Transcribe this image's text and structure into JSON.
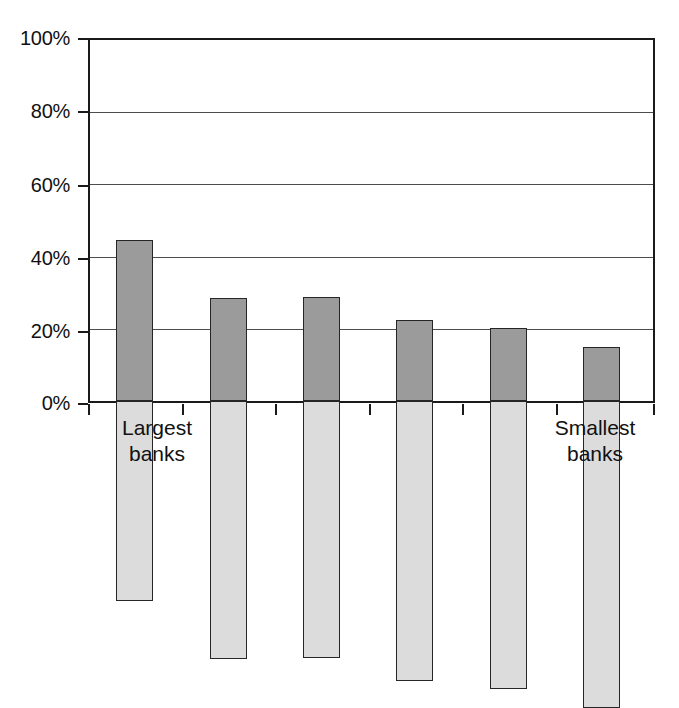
{
  "chart_data": {
    "type": "bar",
    "title": "",
    "subtitle": "",
    "xlabel": "",
    "ylabel": "",
    "stacked": true,
    "normalized": true,
    "grid": true,
    "legend": "none",
    "ylim": [
      0,
      100
    ],
    "yticks": [
      0,
      20,
      40,
      60,
      80,
      100
    ],
    "ytick_labels": [
      "0%",
      "20%",
      "40%",
      "60%",
      "80%",
      "100%"
    ],
    "categories": [
      "1",
      "2",
      "3",
      "4",
      "5",
      "6"
    ],
    "category_axis_labels": {
      "left_line1": "Largest",
      "left_line2": "banks",
      "right_line1": "Smallest",
      "right_line2": "banks"
    },
    "series": [
      {
        "name": "lower-segment",
        "color": "#9b9b9b",
        "values": [
          44.5,
          28.5,
          28.7,
          22.5,
          20.2,
          15.0
        ]
      },
      {
        "name": "upper-segment",
        "color": "#dcdcdc",
        "values": [
          55.5,
          71.5,
          71.3,
          77.5,
          79.8,
          85.0
        ]
      }
    ],
    "colors": {
      "lower_segment": "#9b9b9b",
      "upper_segment": "#dcdcdc",
      "axis": "#1a1a1a",
      "gridline": "#4d4d4d",
      "bar_outline": "#262626",
      "background": "#ffffff",
      "text": "#111111"
    }
  }
}
